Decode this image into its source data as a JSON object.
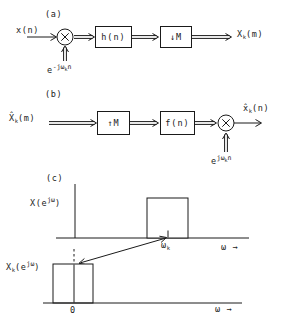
{
  "figure": {
    "colors": {
      "ink": "#1a1a1a",
      "background": "#ffffff"
    },
    "panel_a": {
      "tag": "(a)",
      "input_label": "x(n)",
      "filter_box": "h(n)",
      "decimator_box": "↓M",
      "output": {
        "base": "X",
        "sub": "k",
        "args": "(m)"
      },
      "modulator": {
        "base": "e",
        "sup_pre": "-jω",
        "sup_sub": "k",
        "sup_post": "n"
      }
    },
    "panel_b": {
      "tag": "(b)",
      "input": {
        "base": "X̂",
        "sub": "k",
        "args": "(m)"
      },
      "interpolator_box": "↑M",
      "filter_box": "f(n)",
      "output": {
        "base": "x̂",
        "sub": "k",
        "args": "(n)"
      },
      "modulator": {
        "base": "e",
        "sup_pre": "jω",
        "sup_sub": "k",
        "sup_post": "n"
      }
    },
    "panel_c": {
      "tag": "(c)",
      "top_plot": {
        "ylabel": {
          "pre": "X(e",
          "sup": "jω",
          "post": ")"
        },
        "xlabel": "ω →",
        "tick_label": {
          "base": "ω",
          "sub": "k"
        },
        "band": {
          "center": "ωk",
          "shape": "rectangular passband"
        }
      },
      "bottom_plot": {
        "ylabel": {
          "pre": "X",
          "sub": "k",
          "mid": "(e",
          "sup": "jω",
          "post": ")"
        },
        "xlabel": "ω →",
        "origin_label": "0",
        "band": {
          "center": "0",
          "shape": "rectangular passband"
        }
      }
    }
  }
}
